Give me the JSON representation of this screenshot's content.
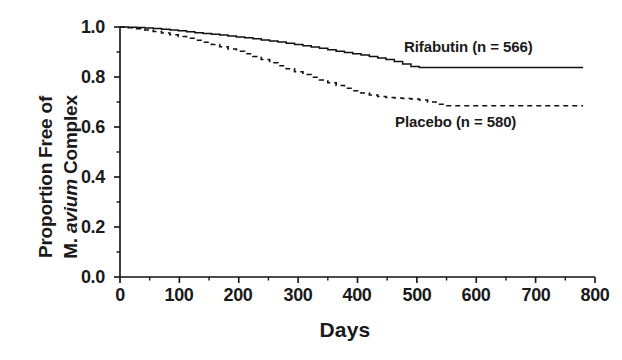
{
  "chart_data": {
    "type": "line",
    "title": "",
    "subtitle": "",
    "xlabel": "Days",
    "ylabel": "Proportion Free of M. avium Complex",
    "ylabel_lines": [
      "Proportion Free of",
      "M. avium Complex"
    ],
    "ylabel_italic_word": "avium",
    "xlim": [
      0,
      800
    ],
    "ylim": [
      0.0,
      1.0
    ],
    "xticks": [
      0,
      100,
      200,
      300,
      400,
      500,
      600,
      700,
      800
    ],
    "xtick_labels": [
      "0",
      "100",
      "200",
      "300",
      "400",
      "500",
      "600",
      "700",
      "800"
    ],
    "xminor_step": 50,
    "yticks": [
      0.0,
      0.2,
      0.4,
      0.6,
      0.8,
      1.0
    ],
    "ytick_labels": [
      "0.0",
      "0.2",
      "0.4",
      "0.6",
      "0.8",
      "1.0"
    ],
    "yminor_step": 0.1,
    "grid": false,
    "legend_position": "inline-annotations",
    "line_color": "#111111",
    "background_color": "#ffffff",
    "series": [
      {
        "name": "Rifabutin (n = 566)",
        "label": "Rifabutin (n = 566)",
        "n": 566,
        "style": "solid",
        "annotation_x": 575,
        "annotation_y": 0.905,
        "x": [
          0,
          14,
          28,
          42,
          56,
          70,
          84,
          98,
          112,
          126,
          140,
          154,
          168,
          182,
          196,
          210,
          224,
          238,
          252,
          266,
          280,
          294,
          308,
          322,
          336,
          350,
          364,
          378,
          392,
          406,
          420,
          434,
          448,
          462,
          476,
          490,
          504,
          560,
          620,
          680,
          740,
          780
        ],
        "y": [
          1.0,
          0.999,
          0.998,
          0.996,
          0.994,
          0.991,
          0.988,
          0.985,
          0.981,
          0.977,
          0.974,
          0.971,
          0.968,
          0.964,
          0.96,
          0.957,
          0.953,
          0.948,
          0.944,
          0.94,
          0.935,
          0.93,
          0.925,
          0.92,
          0.915,
          0.909,
          0.903,
          0.898,
          0.893,
          0.888,
          0.882,
          0.876,
          0.87,
          0.862,
          0.852,
          0.842,
          0.838,
          0.838,
          0.838,
          0.838,
          0.838,
          0.838
        ]
      },
      {
        "name": "Placebo (n = 580)",
        "label": "Placebo (n = 580)",
        "n": 580,
        "style": "dashed",
        "annotation_x": 555,
        "annotation_y": 0.6,
        "x": [
          0,
          14,
          28,
          42,
          56,
          70,
          84,
          98,
          112,
          126,
          140,
          154,
          168,
          182,
          196,
          210,
          224,
          238,
          252,
          266,
          280,
          294,
          308,
          322,
          336,
          350,
          364,
          378,
          392,
          406,
          420,
          434,
          448,
          462,
          476,
          490,
          504,
          518,
          532,
          546,
          600,
          660,
          720,
          780
        ],
        "y": [
          1.0,
          0.997,
          0.993,
          0.988,
          0.982,
          0.976,
          0.969,
          0.962,
          0.955,
          0.947,
          0.939,
          0.93,
          0.921,
          0.912,
          0.903,
          0.893,
          0.882,
          0.87,
          0.857,
          0.845,
          0.833,
          0.821,
          0.81,
          0.799,
          0.788,
          0.777,
          0.766,
          0.755,
          0.745,
          0.736,
          0.728,
          0.722,
          0.718,
          0.716,
          0.714,
          0.712,
          0.708,
          0.7,
          0.691,
          0.685,
          0.685,
          0.685,
          0.685,
          0.685
        ]
      }
    ]
  },
  "axis": {
    "x_label": "Days",
    "y_label_top": "Proportion Free of",
    "y_label_bottom_pre": "M. ",
    "y_label_bottom_italic": "avium",
    "y_label_bottom_post": " Complex"
  }
}
